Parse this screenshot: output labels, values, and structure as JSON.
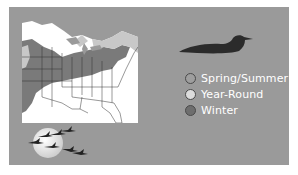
{
  "range_map": {
    "title": "Common Loon range map",
    "region": "Eastern United States",
    "colors": {
      "panel": "#9a9a9a",
      "map_background": "#ffffff",
      "land_dark": "#7a7a7a",
      "land_light": "#c8c8c8",
      "borders": "#333333"
    }
  },
  "bird_icon": {
    "name": "loon-silhouette",
    "color": "#2b2b2b"
  },
  "legend": {
    "items": [
      {
        "label": "Spring/Summer",
        "color": "#9e9e9e"
      },
      {
        "label": "Year-Round",
        "color": "#dcdcdc"
      },
      {
        "label": "Winter",
        "color": "#6e6e6e"
      }
    ]
  },
  "decoration": {
    "name": "moon-with-flying-birds",
    "moon_color": "#e8e8e8",
    "bird_color": "#222222"
  }
}
